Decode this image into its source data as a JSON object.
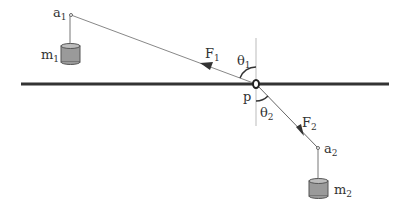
{
  "diagram": {
    "title": "",
    "labels": {
      "a1": "a",
      "a1_sub": "1",
      "m1": "m",
      "m1_sub": "1",
      "F1": "F",
      "F1_sub": "1",
      "theta1": "θ",
      "theta1_sub": "1",
      "p": "p",
      "theta2": "θ",
      "theta2_sub": "2",
      "F2": "F",
      "F2_sub": "2",
      "a2": "a",
      "a2_sub": "2",
      "m2": "m",
      "m2_sub": "2"
    },
    "colors": {
      "bar": "#333333",
      "string": "#888888",
      "mass_fill": "#9a9a9a",
      "mass_top": "#bdbdbd",
      "text": "#333333"
    }
  }
}
